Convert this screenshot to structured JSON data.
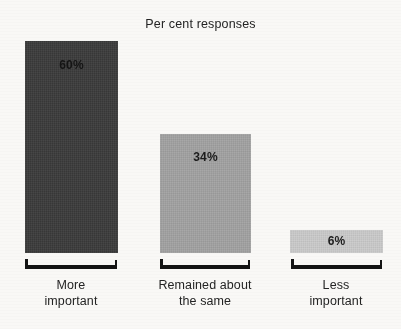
{
  "chart_data": {
    "type": "bar",
    "title": "Per cent responses",
    "xlabel": "",
    "ylabel": "",
    "ylim": [
      0,
      60
    ],
    "grid": false,
    "legend": "none",
    "orientation": "vertical",
    "categories": [
      "More important",
      "Remained about the same",
      "Less important"
    ],
    "category_lines": [
      [
        "More",
        "important"
      ],
      [
        "Remained about",
        "the same"
      ],
      [
        "Less",
        "important"
      ]
    ],
    "values": [
      60,
      34,
      6
    ],
    "data_labels": [
      "60%",
      "34%",
      "6%"
    ],
    "bar_colors": [
      "#3a3a3a",
      "#a2a2a2",
      "#cbcbcb"
    ],
    "axis_style": "bracket",
    "axis_color": "#141414",
    "background_color": "#f9f8f6"
  }
}
